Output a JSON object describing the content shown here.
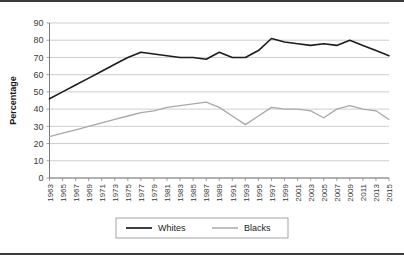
{
  "chart_data": {
    "type": "line",
    "title": "",
    "xlabel": "",
    "ylabel": "Percentage",
    "ylim": [
      0,
      90
    ],
    "ytick_step": 10,
    "yticks": [
      0,
      10,
      20,
      30,
      40,
      50,
      60,
      70,
      80,
      90
    ],
    "grid": true,
    "legend_position": "bottom",
    "x": [
      1963,
      1965,
      1967,
      1969,
      1971,
      1973,
      1975,
      1977,
      1979,
      1981,
      1983,
      1985,
      1987,
      1989,
      1991,
      1993,
      1995,
      1997,
      1999,
      2001,
      2003,
      2005,
      2007,
      2009,
      2011,
      2013,
      2015
    ],
    "categories": [
      "1963",
      "1965",
      "1967",
      "1969",
      "1971",
      "1973",
      "1975",
      "1977",
      "1979",
      "1981",
      "1983",
      "1985",
      "1987",
      "1989",
      "1991",
      "1993",
      "1995",
      "1997",
      "1999",
      "2001",
      "2003",
      "2005",
      "2007",
      "2009",
      "2011",
      "2013",
      "2015"
    ],
    "series": [
      {
        "name": "Whites",
        "color": "#1c1c1c",
        "values": [
          46,
          50,
          54,
          58,
          62,
          66,
          70,
          73,
          72,
          71,
          70,
          70,
          69,
          73,
          70,
          70,
          74,
          81,
          79,
          78,
          77,
          78,
          77,
          80,
          77,
          74,
          71
        ]
      },
      {
        "name": "Blacks",
        "color": "#a8a8a8",
        "values": [
          24,
          26,
          28,
          30,
          32,
          34,
          36,
          38,
          39,
          41,
          42,
          43,
          44,
          41,
          36,
          31,
          36,
          41,
          40,
          40,
          39,
          35,
          40,
          42,
          40,
          39,
          34
        ]
      }
    ]
  },
  "legend": {
    "items": [
      {
        "label": "Whites",
        "color": "#1c1c1c"
      },
      {
        "label": "Blacks",
        "color": "#a8a8a8"
      }
    ]
  },
  "axis": {
    "y_title": "Percentage"
  }
}
